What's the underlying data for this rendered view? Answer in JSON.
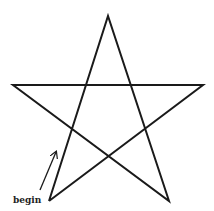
{
  "diagram": {
    "type": "pentagram",
    "stroke_color": "#1a1a1a",
    "stroke_width": 2,
    "vertices": {
      "top": [
        108,
        16
      ],
      "left": [
        13,
        85
      ],
      "right": [
        203,
        85
      ],
      "bottom_left": [
        49,
        201
      ],
      "bottom_right": [
        169,
        201
      ]
    },
    "start_label": "begin",
    "start_arrow": {
      "from": [
        40,
        190
      ],
      "to": [
        56,
        152
      ]
    }
  }
}
